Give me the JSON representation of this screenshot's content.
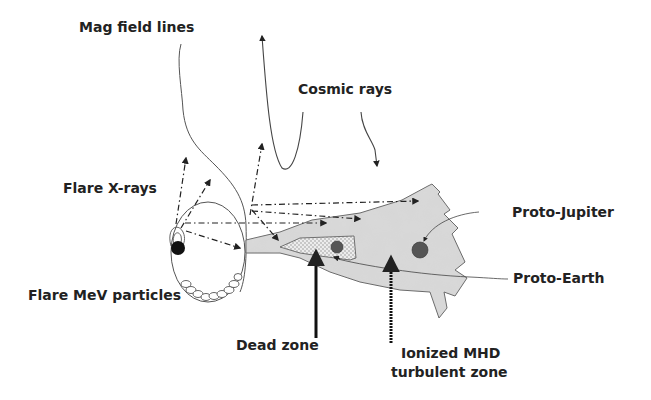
{
  "labels": {
    "mag_field_lines": "Mag field lines",
    "cosmic_rays": "Cosmic rays",
    "flare_xrays": "Flare X-rays",
    "flare_mev": "Flare MeV particles",
    "proto_jupiter": "Proto-Jupiter",
    "proto_earth": "Proto-Earth",
    "dead_zone": "Dead zone",
    "ionized_line1": "Ionized MHD",
    "ionized_line2": "turbulent zone"
  },
  "colors": {
    "disk_fill": "#d4d4d4",
    "disk_stroke": "#666666",
    "dead_zone_fill": "#bcbcbc",
    "planet_fill": "#555555",
    "line": "#333333",
    "star": "#111111"
  }
}
